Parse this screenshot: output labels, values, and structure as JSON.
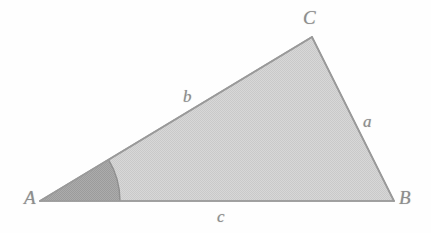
{
  "figure": {
    "kind": "geometry-diagram",
    "background_color": "#fefefe",
    "width": 431,
    "height": 233
  },
  "chart_data": {
    "type": "diagram",
    "title": "",
    "vertices": [
      {
        "name": "A",
        "x": 40,
        "y": 201
      },
      {
        "name": "B",
        "x": 394,
        "y": 201
      },
      {
        "name": "C",
        "x": 312,
        "y": 37
      }
    ],
    "sides": [
      {
        "name": "a",
        "from": "B",
        "to": "C",
        "label": "a"
      },
      {
        "name": "b",
        "from": "A",
        "to": "C",
        "label": "b"
      },
      {
        "name": "c",
        "from": "A",
        "to": "B",
        "label": "c"
      }
    ],
    "angle_marker": {
      "at_vertex": "A",
      "radius": 80,
      "style": "filled-sector",
      "fill": "#a8a8a8"
    },
    "grid": false,
    "legend": false
  },
  "labels": {
    "vertex_a": "A",
    "vertex_b": "B",
    "vertex_c": "C",
    "side_a": "a",
    "side_b": "b",
    "side_c": "c"
  },
  "colors": {
    "triangle_fill": "#d4d4d4",
    "triangle_stroke": "#9a9a9a",
    "angle_sector_fill": "#a6a6a6",
    "angle_sector_stroke": "#949494",
    "label_text": "#8d8d8d",
    "background": "#fefefe"
  }
}
